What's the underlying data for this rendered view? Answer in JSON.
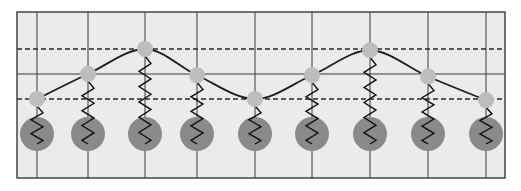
{
  "diagram": {
    "title": "",
    "colors": {
      "background_panel": "#ebebeb",
      "frame": "#3a3a3a",
      "grid_line": "#3a3a3a",
      "dashed_line": "#2a2a2a",
      "string": "#1e1e1e",
      "spring": "#111111",
      "node": "#bdbdbd",
      "mass": "#8a8a8a"
    },
    "reference_lines": [
      {
        "name": "upper-amplitude-line",
        "style": "dashed",
        "level": 1
      },
      {
        "name": "equilibrium-line",
        "style": "solid",
        "level": 0
      },
      {
        "name": "lower-amplitude-line",
        "style": "dashed",
        "level": -1
      }
    ],
    "oscillators": [
      {
        "index": 1,
        "displacement": -1.0
      },
      {
        "index": 2,
        "displacement": 0.0
      },
      {
        "index": 3,
        "displacement": 1.0
      },
      {
        "index": 4,
        "displacement": -0.05
      },
      {
        "index": 5,
        "displacement": -1.0
      },
      {
        "index": 6,
        "displacement": -0.05
      },
      {
        "index": 7,
        "displacement": 0.95
      },
      {
        "index": 8,
        "displacement": -0.1
      },
      {
        "index": 9,
        "displacement": -1.05
      }
    ]
  }
}
